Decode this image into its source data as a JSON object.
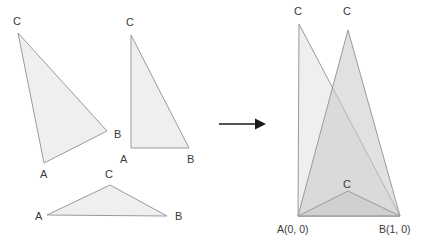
{
  "figure": {
    "background_color": "#ffffff",
    "fill_color": "#efefef",
    "overlay_fill_color": "#c9c9c9",
    "stroke_color": "#9a9a9a",
    "arrow_color": "#1a1a1a",
    "label_color": "#3a3a3a"
  },
  "left_panel": {
    "name": "source-triangles",
    "triangles": [
      {
        "id": "triangle-1",
        "points": "18,33 107,131 44,163",
        "vertices": [
          {
            "label": "C",
            "x": 18,
            "y": 33,
            "label_x": 13,
            "label_y": 25
          },
          {
            "label": "B",
            "x": 107,
            "y": 131,
            "label_x": 114,
            "label_y": 138
          },
          {
            "label": "A",
            "x": 44,
            "y": 163,
            "label_x": 40,
            "label_y": 178
          }
        ]
      },
      {
        "id": "triangle-2",
        "points": "131,35 189,148 131,148",
        "vertices": [
          {
            "label": "C",
            "x": 131,
            "y": 35,
            "label_x": 126,
            "label_y": 26
          },
          {
            "label": "B",
            "x": 189,
            "y": 148,
            "label_x": 187,
            "label_y": 163
          },
          {
            "label": "A",
            "x": 131,
            "y": 148,
            "label_x": 120,
            "label_y": 163
          }
        ]
      },
      {
        "id": "triangle-3",
        "points": "110,185 167,216 47,215",
        "vertices": [
          {
            "label": "C",
            "x": 110,
            "y": 185,
            "label_x": 105,
            "label_y": 178
          },
          {
            "label": "B",
            "x": 167,
            "y": 216,
            "label_x": 175,
            "label_y": 220
          },
          {
            "label": "A",
            "x": 47,
            "y": 215,
            "label_x": 35,
            "label_y": 220
          }
        ]
      }
    ]
  },
  "arrow": {
    "name": "transform-arrow",
    "x1": 219,
    "y1": 124,
    "x2": 256,
    "y2": 124,
    "head": "256,118 266,124 256,130"
  },
  "right_panel": {
    "name": "mapped-triangles",
    "base": {
      "a_label": "A(0, 0)",
      "b_label": "B(1, 0)",
      "a_x": 298,
      "a_y": 216,
      "b_x": 400,
      "b_y": 216,
      "a_label_x": 277,
      "a_label_y": 232,
      "b_label_x": 380,
      "b_label_y": 232
    },
    "triangles": [
      {
        "id": "mapped-triangle-1",
        "points": "299,24 400,216 298,216",
        "apex": {
          "label": "C",
          "x": 299,
          "y": 24,
          "label_x": 294,
          "label_y": 15
        }
      },
      {
        "id": "mapped-triangle-2",
        "points": "348,30 400,216 298,216",
        "apex": {
          "label": "C",
          "x": 348,
          "y": 30,
          "label_x": 343,
          "label_y": 15
        }
      },
      {
        "id": "mapped-triangle-3",
        "points": "348,191 400,216 298,216",
        "apex": {
          "label": "C",
          "x": 348,
          "y": 191,
          "label_x": 343,
          "label_y": 187
        }
      }
    ]
  }
}
